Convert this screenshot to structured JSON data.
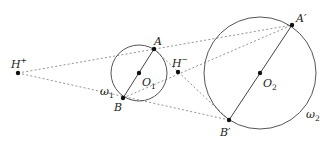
{
  "diagram": {
    "colors": {
      "stroke": "#444444",
      "dashed": "#777777",
      "point": "#111111",
      "label": "#222222"
    },
    "circles": [
      {
        "id": "omega1",
        "label": "ω",
        "label_sub": "1",
        "cx": 139,
        "cy": 73,
        "r": 28,
        "center_label": "O",
        "center_sub": "1"
      },
      {
        "id": "omega2",
        "label": "ω",
        "label_sub": "2",
        "cx": 260,
        "cy": 73,
        "r": 56,
        "center_label": "O",
        "center_sub": "2"
      }
    ],
    "points": {
      "H_plus": {
        "x": 18,
        "y": 73,
        "label": "H",
        "sup": "+"
      },
      "H_minus": {
        "x": 178,
        "y": 72,
        "label": "H",
        "sup": "−"
      },
      "A": {
        "x": 154,
        "y": 49,
        "label": "A"
      },
      "B": {
        "x": 123,
        "y": 98,
        "label": "B"
      },
      "A_prime": {
        "x": 292,
        "y": 25,
        "label": "A′"
      },
      "B_prime": {
        "x": 229,
        "y": 120,
        "label": "B′"
      },
      "O1": {
        "x": 139,
        "y": 73
      },
      "O2": {
        "x": 260,
        "y": 73
      }
    },
    "segments_solid": [
      [
        "A",
        "B"
      ],
      [
        "A_prime",
        "B_prime"
      ]
    ],
    "segments_dashed": [
      [
        "H_plus",
        "A_prime"
      ],
      [
        "H_plus",
        "B_prime"
      ],
      [
        "B",
        "A_prime"
      ],
      [
        "A",
        "B_prime"
      ]
    ]
  },
  "labels": {
    "H_plus": "H",
    "H_plus_sup": "+",
    "H_minus": "H",
    "H_minus_sup": "−",
    "A": "A",
    "B": "B",
    "A_prime": "A′",
    "B_prime": "B′",
    "O1": "O",
    "O1_sub": "1",
    "O2": "O",
    "O2_sub": "2",
    "omega1": "ω",
    "omega1_sub": "1",
    "omega2": "ω",
    "omega2_sub": "2"
  }
}
